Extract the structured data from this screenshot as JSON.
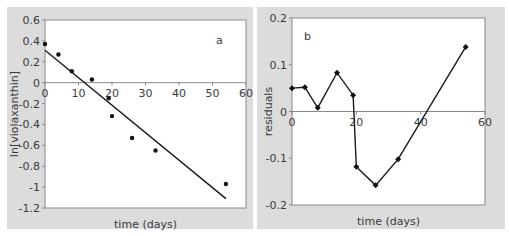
{
  "chart_data": [
    {
      "id": "a",
      "type": "scatter",
      "panel_label": "a",
      "title": "",
      "xlabel": "time (days)",
      "ylabel": "ln[violaxanthin]",
      "xlim": [
        0,
        60
      ],
      "ylim": [
        -1.2,
        0.6
      ],
      "xticks": [
        0,
        10,
        20,
        30,
        40,
        50,
        60
      ],
      "yticks": [
        0.6,
        0.4,
        0.2,
        0,
        -0.2,
        -0.4,
        -0.6,
        -0.8,
        -1,
        -1.2
      ],
      "ytick_labels": [
        "0.6",
        "0.4",
        "0.2",
        "0",
        "-0.2",
        "-0.4",
        "-0.6",
        "-0.8",
        "-1",
        "-1.2"
      ],
      "grid": false,
      "series": [
        {
          "name": "observed",
          "style": "points",
          "x": [
            0,
            4,
            8,
            14,
            19,
            20,
            26,
            33,
            54
          ],
          "y": [
            0.37,
            0.27,
            0.11,
            0.03,
            -0.15,
            -0.32,
            -0.53,
            -0.65,
            -0.97
          ]
        },
        {
          "name": "linear fit",
          "style": "line",
          "x": [
            0,
            54
          ],
          "y": [
            0.31,
            -1.11
          ]
        }
      ]
    },
    {
      "id": "b",
      "type": "line",
      "panel_label": "b",
      "title": "",
      "xlabel": "time (days)",
      "ylabel": "residuals",
      "xlim": [
        0,
        60
      ],
      "ylim": [
        -0.2,
        0.2
      ],
      "xticks": [
        0,
        20,
        40,
        60
      ],
      "yticks": [
        0.2,
        0.1,
        0,
        -0.1,
        -0.2
      ],
      "ytick_labels": [
        "0.2",
        "0.1",
        "0",
        "-0.1",
        "-0.2"
      ],
      "grid": false,
      "series": [
        {
          "name": "residuals",
          "style": "line+markers",
          "marker": "diamond",
          "x": [
            0,
            4,
            8,
            14,
            19,
            20,
            26,
            33,
            54
          ],
          "y": [
            0.05,
            0.052,
            0.008,
            0.083,
            0.035,
            -0.118,
            -0.158,
            -0.102,
            0.138
          ]
        }
      ]
    }
  ]
}
